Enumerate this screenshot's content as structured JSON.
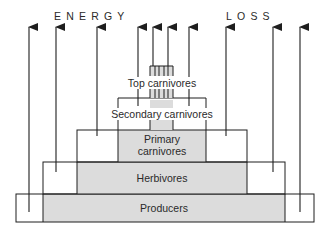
{
  "diagram": {
    "title_left": "ENERGY",
    "title_right": "LOSS",
    "colors": {
      "line": "#1e1e1e",
      "fill": "#dcdcdc",
      "background": "#ffffff",
      "text": "#2a2a2a"
    },
    "levels": [
      {
        "id": "producers",
        "label": "Producers"
      },
      {
        "id": "herbivores",
        "label": "Herbivores"
      },
      {
        "id": "primary-carnivores",
        "label_line1": "Primary",
        "label_line2": "carnivores"
      },
      {
        "id": "secondary-carnivores",
        "label": "Secondary carnivores"
      },
      {
        "id": "top-carnivores",
        "label": "Top carnivores"
      }
    ],
    "arrow_count": 10
  }
}
